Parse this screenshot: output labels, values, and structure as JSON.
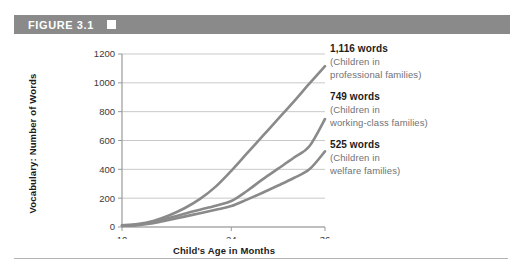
{
  "figure": {
    "header_label": "FIGURE 3.1",
    "header_marker": "white-square-marker",
    "header_color": "#8a8a8a"
  },
  "chart_data": {
    "type": "line",
    "title": "FIGURE 3.1",
    "xlabel": "Child's Age in Months",
    "ylabel": "Vocabulary: Number of Words",
    "xlim": [
      10,
      36
    ],
    "ylim": [
      0,
      1200
    ],
    "xticks": [
      10,
      24,
      36
    ],
    "xtick_labels": [
      "10",
      "24",
      "36"
    ],
    "yticks": [
      0,
      200,
      400,
      600,
      800,
      1000,
      1200
    ],
    "ytick_labels": [
      "0",
      "200",
      "400",
      "600",
      "800",
      "1000",
      "1200"
    ],
    "grid": "horizontal",
    "legend_position": "right-annotations",
    "line_color": "#8a8a8a",
    "x": [
      10,
      12,
      14,
      16,
      18,
      20,
      22,
      24,
      26,
      28,
      30,
      32,
      34,
      36
    ],
    "series": [
      {
        "name": "Children in professional families",
        "final_value": 1116,
        "final_label": "1,116 words",
        "values": [
          12,
          20,
          42,
          80,
          130,
          195,
          280,
          390,
          510,
          630,
          750,
          870,
          995,
          1116
        ]
      },
      {
        "name": "Children in working-class families",
        "final_value": 749,
        "final_label": "749 words",
        "values": [
          10,
          16,
          34,
          62,
          92,
          120,
          148,
          180,
          250,
          330,
          405,
          480,
          560,
          749
        ]
      },
      {
        "name": "Children in welfare families",
        "final_value": 525,
        "final_label": "525 words",
        "values": [
          8,
          13,
          26,
          48,
          72,
          96,
          120,
          145,
          190,
          238,
          288,
          340,
          400,
          525
        ]
      }
    ],
    "annotations": [
      {
        "value_label": "1,116 words",
        "desc_line1": "(Children in",
        "desc_line2": "professional families)"
      },
      {
        "value_label": "749 words",
        "desc_line1": "(Children in",
        "desc_line2": "working-class families)"
      },
      {
        "value_label": "525 words",
        "desc_line1": "(Children in",
        "desc_line2": "welfare families)"
      }
    ]
  }
}
